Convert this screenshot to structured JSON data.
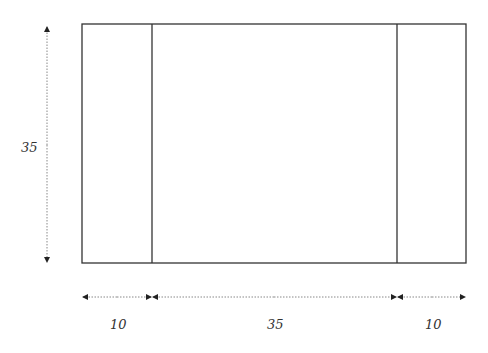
{
  "diagram": {
    "height_label": "35",
    "width_labels": [
      "10",
      "35",
      "10"
    ],
    "colors": {
      "line": "#333333",
      "dim": "#888888",
      "background": "#ffffff"
    },
    "rect": {
      "x": 82,
      "y": 24,
      "w": 384,
      "h": 239
    },
    "dividers_x": [
      152,
      397
    ]
  }
}
